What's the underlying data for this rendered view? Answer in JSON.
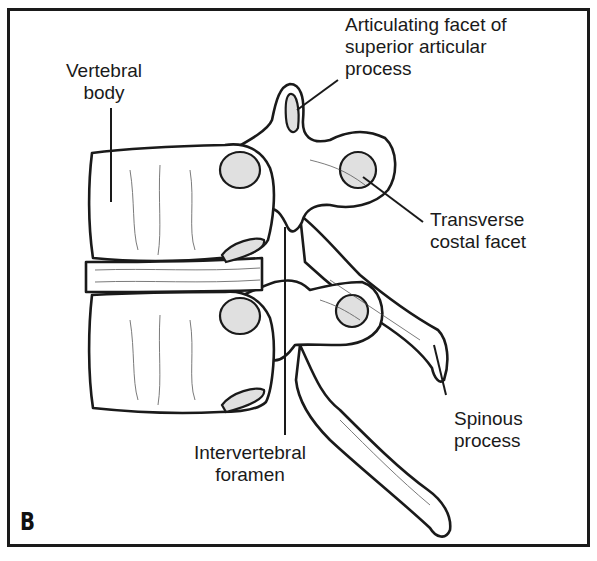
{
  "figure": {
    "panel_letter": "B",
    "colors": {
      "line": "#1a1a1a",
      "fill": "#ffffff",
      "facet_fill": "#e0e0e0",
      "frame": "#1a1a1a"
    }
  },
  "labels": {
    "vertebral_body": [
      "Vertebral",
      "body"
    ],
    "articulating_facet": [
      "Articulating facet of",
      "superior articular",
      "process"
    ],
    "transverse_costal_facet": [
      "Transverse",
      "costal facet"
    ],
    "spinous_process": [
      "Spinous",
      "process"
    ],
    "intervertebral_foramen": [
      "Intervertebral",
      "foramen"
    ]
  }
}
